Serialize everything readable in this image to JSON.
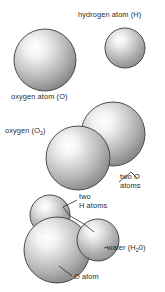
{
  "figure": {
    "background_color": "#ffffff",
    "width": 165,
    "height": 292,
    "labels": {
      "hydrogen_atom": "hydrogen atom (H)",
      "oxygen_atom": "oxygen atom (O)",
      "oxygen_molecule_prefix": "oxygen (O",
      "oxygen_molecule_subscript": "2",
      "oxygen_molecule_suffix": ")",
      "two_o_atoms_line1": "two O",
      "two_o_atoms_line2": "atoms",
      "two_h_atoms_line1": "two",
      "two_h_atoms_line2": "H atoms",
      "water_prefix": "water (H",
      "water_subscript": "2",
      "water_suffix": "0)",
      "o_atom": "O atom"
    },
    "colors": {
      "sphere_highlight": "#ffffff",
      "sphere_midtone": "#c8c8c8",
      "sphere_shadow": "#8c8c8c",
      "sphere_outline": "#3c3c3c",
      "text": "#2b2b2b",
      "leader_line": "#2b2b2b"
    },
    "spheres": [
      {
        "name": "oxygen-atom-sphere",
        "cx": 45,
        "cy": 60,
        "r": 31
      },
      {
        "name": "hydrogen-atom-sphere",
        "cx": 125,
        "cy": 48,
        "r": 20
      },
      {
        "name": "o2-sphere-upper-right",
        "cx": 113,
        "cy": 134,
        "r": 32
      },
      {
        "name": "o2-sphere-lower-left",
        "cx": 78,
        "cy": 158,
        "r": 32
      },
      {
        "name": "water-o-sphere",
        "cx": 57,
        "cy": 250,
        "r": 33
      },
      {
        "name": "water-h-sphere-left",
        "cx": 50,
        "cy": 215,
        "r": 20
      },
      {
        "name": "water-h-sphere-right",
        "cx": 98,
        "cy": 240,
        "r": 21
      }
    ]
  }
}
